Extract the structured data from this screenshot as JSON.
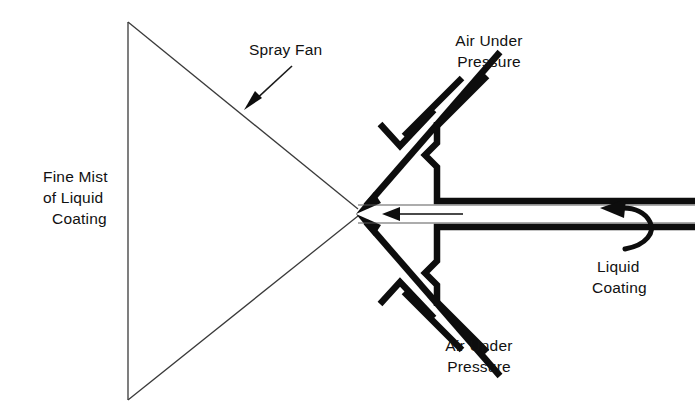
{
  "diagram": {
    "background_color": "#ffffff",
    "ink_color": "#0d0d0d",
    "hairline_color": "#5a5a5a",
    "labels": {
      "spray_fan": "Spray Fan",
      "fine_mist_line1": "Fine Mist",
      "fine_mist_line2": "of  Liquid",
      "fine_mist_line3": "Coating",
      "air_top_line1": "Air Under",
      "air_top_line2": "Pressure",
      "air_bottom_line1": "Air Under",
      "air_bottom_line2": "Pressure",
      "liquid_line1": "Liquid",
      "liquid_line2": "Coating"
    },
    "icons": {
      "spray_fan_pointer": "arrow-down-left-icon",
      "air_top_pointer": "arrow-down-left-icon",
      "air_bottom_pointer": "arrow-up-left-icon",
      "liquid_flow_pointer": "arrow-left-icon",
      "liquid_feed_pointer": "curved-arrow-left-icon"
    },
    "geometry": {
      "fan_apex_x": 358,
      "fan_apex_y": 212,
      "fan_top_vertex_x": 128,
      "fan_top_vertex_y": 22,
      "fan_bottom_vertex_x": 128,
      "fan_bottom_vertex_y": 400
    }
  }
}
